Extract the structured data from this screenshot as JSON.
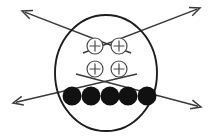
{
  "figure": {
    "background_color": "#ffffff",
    "canvas": {
      "width": 214,
      "height": 137
    }
  },
  "boundary": {
    "label": "boundary-circle",
    "shape": "circle",
    "center_x": 106,
    "center_y": 73,
    "radius_x": 51,
    "radius_y": 58,
    "stroke_color": "#1d1d1d",
    "stroke_width": 1.9
  },
  "charges": {
    "symbol": "plus-in-circle",
    "count": 4,
    "radius": 8,
    "stroke_color": "#4a4a4a",
    "items": [
      {
        "name": "charge-top-left",
        "cx": 95,
        "cy": 46
      },
      {
        "name": "charge-top-right",
        "cx": 119,
        "cy": 46
      },
      {
        "name": "charge-bottom-left",
        "cx": 95,
        "cy": 69
      },
      {
        "name": "charge-bottom-right",
        "cx": 119,
        "cy": 69
      }
    ]
  },
  "particles": {
    "symbol": "filled-dot",
    "count": 5,
    "radius": 9.5,
    "fill_color": "#111111",
    "row_y": 96,
    "items": [
      {
        "name": "particle-1",
        "cx": 72,
        "cy": 96
      },
      {
        "name": "particle-2",
        "cx": 91,
        "cy": 96
      },
      {
        "name": "particle-3",
        "cx": 110,
        "cy": 96
      },
      {
        "name": "particle-4",
        "cx": 128,
        "cy": 96
      },
      {
        "name": "particle-5",
        "cx": 147,
        "cy": 96
      }
    ]
  },
  "arrows": {
    "count": 4,
    "stroke_color": "#3a3a3a",
    "stroke_width": 1.5,
    "head_length": 11,
    "items": [
      {
        "name": "arrow-up-left",
        "direction": "up-left",
        "x1": 131,
        "y1": 53,
        "x2": 22,
        "y2": 11
      },
      {
        "name": "arrow-up-right",
        "direction": "up-right",
        "x1": 83,
        "y1": 53,
        "x2": 200,
        "y2": 8
      },
      {
        "name": "arrow-down-left",
        "direction": "down-left",
        "x1": 137,
        "y1": 74,
        "x2": 13,
        "y2": 103
      },
      {
        "name": "arrow-down-right",
        "direction": "down-right",
        "x1": 76,
        "y1": 74,
        "x2": 201,
        "y2": 107
      }
    ]
  }
}
